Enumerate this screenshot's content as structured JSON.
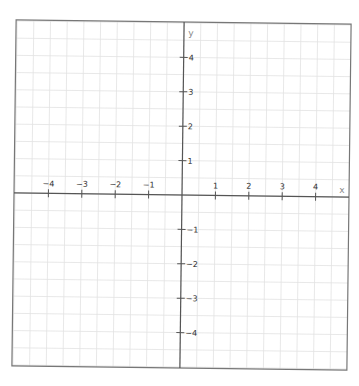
{
  "chart_data": {
    "type": "scatter",
    "title": "",
    "xlabel": "x",
    "ylabel": "y",
    "xlim": [
      -5,
      5
    ],
    "ylim": [
      -5,
      5
    ],
    "grid": true,
    "grid_step": 0.5,
    "x_ticks": [
      -4,
      -3,
      -2,
      -1,
      1,
      2,
      3,
      4
    ],
    "y_ticks": [
      4,
      3,
      2,
      1,
      -1,
      -2,
      -3,
      -4
    ],
    "x_tick_labels": [
      "−4",
      "−3",
      "−2",
      "−1",
      "1",
      "2",
      "3",
      "4"
    ],
    "y_tick_labels": [
      "4",
      "3",
      "2",
      "1",
      "−1",
      "−2",
      "−3",
      "−4"
    ],
    "series": [],
    "colors": {
      "grid": "#e2e2e2",
      "axis": "#555555",
      "border": "#777777",
      "tick_label": "#333333",
      "axis_name": "#888888"
    }
  }
}
